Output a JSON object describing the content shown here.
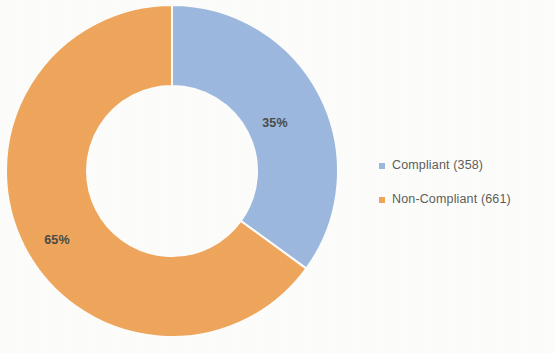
{
  "chart_data": {
    "type": "pie",
    "variant": "donut",
    "title": "",
    "subtitle": "",
    "xlabel": "",
    "ylabel": "",
    "grid": false,
    "legend_position": "right",
    "hole_ratio": 0.51,
    "start_angle_deg": 0,
    "direction": "clockwise",
    "total": 1019,
    "categories": [
      "Compliant",
      "Non-Compliant"
    ],
    "values": [
      358,
      661
    ],
    "percentages": [
      35,
      65
    ],
    "colors": [
      "#9db8df",
      "#efa55c"
    ],
    "slices": [
      {
        "name": "Compliant",
        "value": 358,
        "percent": 35,
        "percent_label": "35%",
        "color": "#9db8df",
        "legend_label": "Compliant (358)",
        "label_x": 275,
        "label_y": 124,
        "start_deg": 0,
        "end_deg": 126
      },
      {
        "name": "Non-Compliant",
        "value": 661,
        "percent": 65,
        "percent_label": "65%",
        "color": "#efa55c",
        "legend_label": "Non-Compliant (661)",
        "label_x": 57,
        "label_y": 241,
        "start_deg": 126,
        "end_deg": 360
      }
    ],
    "geometry": {
      "center_x": 172,
      "center_y": 171,
      "outer_radius": 166,
      "inner_radius": 85
    },
    "label_text_color": "#4a4a45",
    "legend_text_color": "#5d5d5a",
    "background_color": "#fdfdfc"
  }
}
